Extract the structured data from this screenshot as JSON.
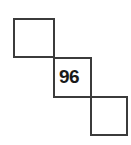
{
  "figure": {
    "width": 131,
    "height": 145,
    "background_color": "#ffffff",
    "stroke_color": "#3b3b3b",
    "stroke_width": 2,
    "label_color": "#1a1a1a"
  },
  "chart_data": {
    "type": "diagram",
    "title": "",
    "shapes": [
      {
        "id": "square-top-left",
        "shape": "square",
        "label": "",
        "x": 13,
        "y": 18,
        "width": 42,
        "height": 40
      },
      {
        "id": "square-middle",
        "shape": "square",
        "label": "96",
        "x": 53,
        "y": 57,
        "width": 39,
        "height": 41
      },
      {
        "id": "square-bottom-right",
        "shape": "square",
        "label": "",
        "x": 90,
        "y": 96,
        "width": 38,
        "height": 40
      }
    ],
    "labels": [
      {
        "id": "label-96",
        "text": "96",
        "belongs_to": "square-middle",
        "x": 59,
        "y": 67
      }
    ]
  }
}
